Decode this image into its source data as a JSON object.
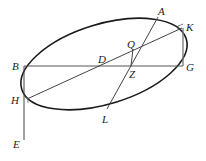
{
  "diagram": {
    "colors": {
      "stroke": "#1a1a1a",
      "thin_stroke": "#555555",
      "label": "#222222"
    },
    "ellipse": {
      "cx": 104,
      "cy": 64,
      "rx": 86,
      "ry": 40,
      "rotation": -17
    },
    "points": {
      "A": {
        "label": "A",
        "x": 158,
        "y": 17,
        "lx": 158,
        "ly": 15
      },
      "K": {
        "label": "K",
        "x": 182,
        "y": 28,
        "lx": 186,
        "ly": 30
      },
      "Q": {
        "label": "Q",
        "x": 133,
        "y": 49,
        "lx": 127,
        "ly": 48
      },
      "B": {
        "label": "B",
        "x": 24,
        "y": 66,
        "lx": 12,
        "ly": 70
      },
      "D": {
        "label": "D",
        "x": 105,
        "y": 66,
        "lx": 98,
        "ly": 62
      },
      "Z": {
        "label": "Z",
        "x": 131,
        "y": 66,
        "lx": 129,
        "ly": 77
      },
      "G": {
        "label": "G",
        "x": 183,
        "y": 66,
        "lx": 186,
        "ly": 71
      },
      "H": {
        "label": "H",
        "x": 27,
        "y": 99,
        "lx": 12,
        "ly": 103
      },
      "L": {
        "label": "L",
        "x": 107,
        "y": 109,
        "lx": 102,
        "ly": 122
      },
      "E": {
        "label": "E",
        "x": 24,
        "y": 140,
        "lx": 13,
        "ly": 147
      }
    },
    "segments": [
      {
        "name": "BG",
        "from": "B",
        "to": "G"
      },
      {
        "name": "KH",
        "from": "K",
        "to": "H"
      },
      {
        "name": "AL",
        "from": "A",
        "to": "L"
      },
      {
        "name": "QZ",
        "from": "Q",
        "to": "Z"
      },
      {
        "name": "KG",
        "from": "K",
        "to": "G"
      },
      {
        "name": "BE",
        "from": "B",
        "to": "E"
      }
    ]
  }
}
